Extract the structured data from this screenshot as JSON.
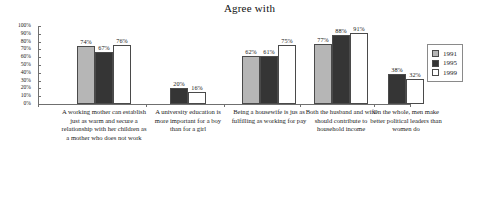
{
  "chart_data": {
    "type": "bar",
    "title": "Agree with",
    "xlabel": "",
    "ylabel": "",
    "ylim": [
      0,
      100
    ],
    "grid": false,
    "legend_position": "right",
    "ytick_labels": [
      "100%",
      "90%",
      "80%",
      "70%",
      "60%",
      "50%",
      "40%",
      "30%",
      "20%",
      "10%",
      "0%"
    ],
    "ytick_values": [
      100,
      90,
      80,
      70,
      60,
      50,
      40,
      30,
      20,
      10,
      0
    ],
    "categories": [
      "A working mother can establish just as warm and secure a relationship with her children as a mother who does not work",
      "A university education is more important for a boy than for a girl",
      "Being a housewife is jus as fulfilling as working for pay",
      "Both the husband and wife should contribute to household income",
      "On the whole, men make better political leaders than women do"
    ],
    "series": [
      {
        "name": "1991",
        "color": "#b6b6b6",
        "values": [
          74,
          null,
          62,
          77,
          null
        ],
        "value_labels": [
          "74%",
          null,
          "62%",
          "77%",
          null
        ]
      },
      {
        "name": "1995",
        "color": "#353535",
        "values": [
          67,
          20,
          61,
          88,
          38
        ],
        "value_labels": [
          "67%",
          "20%",
          "61%",
          "88%",
          "38%"
        ]
      },
      {
        "name": "1999",
        "color": "#ffffff",
        "values": [
          76,
          16,
          75,
          91,
          32
        ],
        "value_labels": [
          "76%",
          "16%",
          "75%",
          "91%",
          "32%"
        ]
      }
    ]
  }
}
